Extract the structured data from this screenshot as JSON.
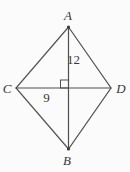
{
  "diagram": {
    "type": "geometry-kite-with-diagonals",
    "background_color": "#fbfbfb",
    "line_color": "#4f4f4f",
    "text_color": "#383838",
    "vertex_labels": {
      "top": "A",
      "bottom": "B",
      "left": "C",
      "right": "D"
    },
    "measurements": {
      "vertical_half_diagonal": "12",
      "horizontal_half_diagonal": "9"
    },
    "right_angle_marker": "square at intersection of diagonals"
  }
}
